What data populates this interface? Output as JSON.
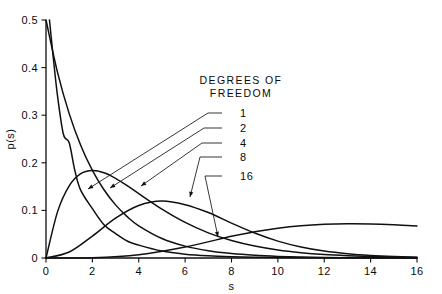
{
  "chart_data": {
    "type": "line",
    "title": "",
    "xlabel": "s",
    "ylabel": "p(s)",
    "xlim": [
      0,
      16
    ],
    "ylim": [
      0,
      0.5
    ],
    "grid": false,
    "legend_position": "inside-upper-right",
    "legend_title_line1": "DEGREES OF",
    "legend_title_line2": "FREEDOM",
    "legend_entries": [
      "1",
      "2",
      "4",
      "8",
      "16"
    ],
    "xticks": [
      0,
      2,
      4,
      6,
      8,
      10,
      12,
      14,
      16
    ],
    "xticklabels": [
      "0",
      "2",
      "4",
      "6",
      "8",
      "10",
      "12",
      "14",
      "16"
    ],
    "yticks": [
      0,
      0.1,
      0.2,
      0.3,
      0.4,
      0.5
    ],
    "yticklabels": [
      "0",
      "0.1",
      "0.2",
      "0.3",
      "0.4",
      "0.5"
    ],
    "series": [
      {
        "name": "1",
        "degrees_of_freedom": 1,
        "peak_s": 0.0,
        "peak_p": 0.5,
        "x": [
          0.15,
          0.3,
          0.5,
          0.75,
          1.0,
          1.25,
          1.5,
          2.0,
          2.5,
          3.0,
          3.5,
          4.0,
          5.0,
          6.0,
          7.0,
          8.0,
          9.0,
          10.0,
          12.0,
          14.0,
          16.0
        ],
        "y": [
          0.5,
          0.4276,
          0.3394,
          0.26,
          0.242,
          0.1826,
          0.142,
          0.1037,
          0.07,
          0.0513,
          0.0357,
          0.027,
          0.0146,
          0.0081,
          0.0046,
          0.0027,
          0.0016,
          0.0009,
          0.0003,
          0.0001,
          0.0001
        ]
      },
      {
        "name": "2",
        "degrees_of_freedom": 2,
        "peak_s": 0.0,
        "peak_p": 0.5,
        "x": [
          0.0,
          0.5,
          1.0,
          1.5,
          2.0,
          2.5,
          3.0,
          3.5,
          4.0,
          5.0,
          6.0,
          7.0,
          8.0,
          9.0,
          10.0,
          11.0,
          12.0,
          13.0,
          14.0,
          15.0,
          16.0
        ],
        "y": [
          0.5,
          0.3894,
          0.3033,
          0.2362,
          0.1839,
          0.1433,
          0.1116,
          0.0869,
          0.0677,
          0.041,
          0.0249,
          0.0151,
          0.0092,
          0.0056,
          0.0034,
          0.002,
          0.0012,
          0.0007,
          0.0005,
          0.0003,
          0.0002
        ]
      },
      {
        "name": "4",
        "degrees_of_freedom": 4,
        "peak_s": 2.0,
        "peak_p": 0.1839,
        "x": [
          0.0,
          0.5,
          1.0,
          1.5,
          2.0,
          2.5,
          3.0,
          3.5,
          4.0,
          5.0,
          6.0,
          7.0,
          8.0,
          9.0,
          10.0,
          11.0,
          12.0,
          13.0,
          14.0,
          15.0,
          16.0
        ],
        "y": [
          0.0,
          0.0974,
          0.1516,
          0.1772,
          0.1839,
          0.1791,
          0.1674,
          0.1521,
          0.1353,
          0.1026,
          0.0747,
          0.0528,
          0.0366,
          0.025,
          0.0168,
          0.0112,
          0.0074,
          0.0049,
          0.0032,
          0.0021,
          0.0013
        ]
      },
      {
        "name": "8",
        "degrees_of_freedom": 8,
        "peak_s": 6.0,
        "peak_p": 0.112,
        "x": [
          0.0,
          1.0,
          2.0,
          3.0,
          4.0,
          5.0,
          6.0,
          7.0,
          8.0,
          9.0,
          10.0,
          11.0,
          12.0,
          13.0,
          14.0,
          15.0,
          16.0
        ],
        "y": [
          0.0,
          0.0126,
          0.046,
          0.0837,
          0.1104,
          0.1198,
          0.112,
          0.0955,
          0.0733,
          0.0524,
          0.0355,
          0.0231,
          0.0145,
          0.0089,
          0.0053,
          0.0031,
          0.0018
        ]
      },
      {
        "name": "16",
        "degrees_of_freedom": 16,
        "peak_s": 14.0,
        "peak_p": 0.066,
        "x": [
          0.0,
          2.0,
          4.0,
          6.0,
          8.0,
          9.0,
          10.0,
          11.0,
          12.0,
          13.0,
          14.0,
          15.0,
          16.0
        ],
        "y": [
          0.0,
          0.0005,
          0.0069,
          0.0231,
          0.0456,
          0.0551,
          0.0625,
          0.0678,
          0.0708,
          0.072,
          0.0716,
          0.0699,
          0.0673
        ]
      }
    ]
  }
}
